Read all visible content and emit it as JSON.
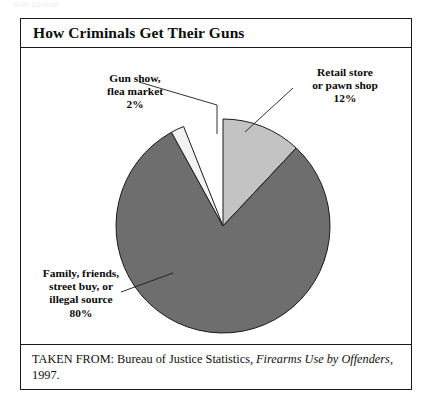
{
  "scan": {
    "header_text": "Gun Control"
  },
  "figure": {
    "title": "How Criminals Get Their Guns",
    "source_prefix": "TAKEN FROM: Bureau of Justice Statistics, ",
    "source_italic": "Firearms Use by Offenders",
    "source_suffix": ", 1997."
  },
  "callouts": {
    "gunshow": "Gun show,\nflea market\n2%",
    "retail": "Retail store\nor pawn shop\n12%",
    "family": "Family, friends,\nstreet buy, or\nillegal source\n80%"
  },
  "colors": {
    "slice_family": "#6e6e6e",
    "slice_retail": "#c3c3c3",
    "slice_gunshow": "#f2f2f2",
    "outline": "#1a1a1a",
    "frame": "#1a1a1a",
    "text": "#0a0a0a",
    "page_background": "#ffffff"
  },
  "chart_data": {
    "type": "pie",
    "title": "How Criminals Get Their Guns",
    "subtitle": "",
    "xlabel": "",
    "ylabel": "",
    "grid": false,
    "legend": "callout-labels",
    "units": "percent",
    "total": 94,
    "center": {
      "x": 202,
      "y": 178
    },
    "radius": 107,
    "start_angle_deg": 0,
    "direction": "clockwise",
    "slices": [
      {
        "label": "Retail store or pawn shop",
        "label_lines": [
          "Retail store",
          "or pawn shop",
          "12%"
        ],
        "value": 12,
        "color": "#c3c3c3",
        "start_deg": 0,
        "end_deg": 43.2,
        "leader": "diagonal"
      },
      {
        "label": "Family, friends, street buy, or illegal source",
        "label_lines": [
          "Family, friends,",
          "street buy, or",
          "illegal source",
          "80%"
        ],
        "value": 80,
        "color": "#6e6e6e",
        "start_deg": 43.2,
        "end_deg": 331.2,
        "leader": "diagonal"
      },
      {
        "label": "Gun show, flea market",
        "label_lines": [
          "Gun show,",
          "flea market",
          "2%"
        ],
        "value": 2,
        "color": "#f2f2f2",
        "start_deg": 331.2,
        "end_deg": 338.4,
        "leader": "elbow"
      }
    ],
    "categories": [
      "Family, friends, street buy, or illegal source",
      "Retail store or pawn shop",
      "Gun show, flea market"
    ],
    "values": [
      80,
      12,
      2
    ]
  }
}
